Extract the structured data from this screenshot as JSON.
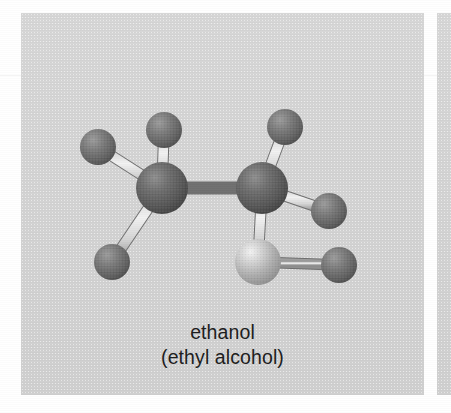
{
  "figure": {
    "caption_line_1": "ethanol",
    "caption_line_2": "(ethyl alcohol)",
    "panel_background": "#d4d4d4",
    "page_background": "#ffffff",
    "caption_color": "#1c1c1c"
  },
  "molecule": {
    "name": "ethanol",
    "synonym": "ethyl alcohol",
    "formula": "C2H6O",
    "model_type": "ball-and-stick",
    "atom_colors": {
      "carbon": "#5a5a5a",
      "hydrogen": "#6f6f6f",
      "oxygen": "#b9b9b9",
      "bond": "#d8d8d8"
    },
    "atoms": [
      {
        "id": "C1",
        "element": "C",
        "label": "carbon",
        "x": 162,
        "y": 188,
        "r": 26
      },
      {
        "id": "C2",
        "element": "C",
        "label": "carbon",
        "x": 262,
        "y": 188,
        "r": 26
      },
      {
        "id": "O1",
        "element": "O",
        "label": "oxygen",
        "x": 258,
        "y": 262,
        "r": 23
      },
      {
        "id": "H1",
        "element": "H",
        "label": "hydrogen",
        "x": 98,
        "y": 147,
        "r": 18
      },
      {
        "id": "H2",
        "element": "H",
        "label": "hydrogen",
        "x": 164,
        "y": 130,
        "r": 18
      },
      {
        "id": "H3",
        "element": "H",
        "label": "hydrogen",
        "x": 112,
        "y": 262,
        "r": 18
      },
      {
        "id": "H4",
        "element": "H",
        "label": "hydrogen",
        "x": 285,
        "y": 127,
        "r": 18
      },
      {
        "id": "H5",
        "element": "H",
        "label": "hydrogen",
        "x": 329,
        "y": 211,
        "r": 18
      },
      {
        "id": "H6",
        "element": "H",
        "label": "hydrogen",
        "x": 339,
        "y": 265,
        "r": 18
      }
    ],
    "bonds": [
      {
        "from": "C1",
        "to": "C2"
      },
      {
        "from": "C1",
        "to": "H1"
      },
      {
        "from": "C1",
        "to": "H2"
      },
      {
        "from": "C1",
        "to": "H3"
      },
      {
        "from": "C2",
        "to": "H4"
      },
      {
        "from": "C2",
        "to": "H5"
      },
      {
        "from": "C2",
        "to": "O1"
      },
      {
        "from": "O1",
        "to": "H6"
      }
    ]
  }
}
